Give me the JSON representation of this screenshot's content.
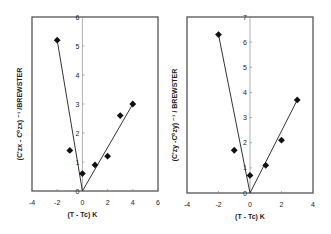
{
  "chart_data": [
    {
      "type": "scatter",
      "title": "",
      "xlabel": "(T - Tc) K",
      "ylabel": "(C'zx - C⁰zx) ⁻¹ /BREWSTER",
      "xlim": [
        -4,
        6
      ],
      "ylim": [
        0,
        6
      ],
      "xticks": [
        "-4",
        "-2",
        "0",
        "2",
        "4",
        "6"
      ],
      "yticks": [
        "0",
        "1",
        "2",
        "3",
        "4",
        "5",
        "6"
      ],
      "grid": false,
      "series": [
        {
          "name": "data",
          "marker": "diamond",
          "x": [
            -2,
            -1,
            0,
            1,
            2,
            3,
            4
          ],
          "y": [
            5.2,
            1.4,
            0.6,
            0.9,
            1.2,
            2.6,
            3.0
          ]
        }
      ],
      "fit_lines": [
        {
          "x": [
            -2,
            0
          ],
          "y": [
            5.2,
            0
          ]
        },
        {
          "x": [
            0,
            4
          ],
          "y": [
            0,
            3.0
          ]
        }
      ]
    },
    {
      "type": "scatter",
      "title": "",
      "xlabel": "(T - Tc) K",
      "ylabel": "(C'zy -C⁰zy) ⁻¹ / BREWSTER",
      "xlim": [
        -4,
        4
      ],
      "ylim": [
        0,
        7
      ],
      "xticks": [
        "-4",
        "-2",
        "0",
        "2",
        "4"
      ],
      "yticks": [
        "0",
        "1",
        "2",
        "3",
        "4",
        "5",
        "6",
        "7"
      ],
      "grid": false,
      "series": [
        {
          "name": "data",
          "marker": "diamond",
          "x": [
            -2,
            -1,
            0,
            1,
            2,
            3
          ],
          "y": [
            6.3,
            1.7,
            0.7,
            1.1,
            2.1,
            3.7
          ]
        }
      ],
      "fit_lines": [
        {
          "x": [
            -2,
            0
          ],
          "y": [
            6.3,
            0
          ]
        },
        {
          "x": [
            0,
            3
          ],
          "y": [
            0,
            3.7
          ]
        }
      ]
    }
  ],
  "left": {
    "ylabel": "(C'zx - C⁰zx) ⁻¹ /BREWSTER",
    "xlabel": "(T - Tc) K"
  },
  "right": {
    "ylabel": "(C'zy -C⁰zy) ⁻¹ / BREWSTER",
    "xlabel": "(T - Tc) K"
  }
}
